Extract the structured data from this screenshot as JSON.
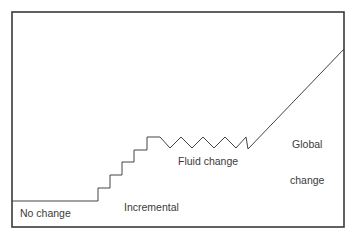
{
  "diagram": {
    "type": "change-progression",
    "colors": {
      "frame": "#3a3a3a",
      "line": "#444444",
      "text": "#3a3a3a",
      "background": "#ffffff"
    },
    "frame": {
      "x1": 12,
      "y1": 12,
      "x2": 344,
      "y2": 227
    },
    "segments": [
      {
        "name": "no-change",
        "label": "No change"
      },
      {
        "name": "incremental-change",
        "label_line1": "Incremental",
        "label_line2": "change",
        "steps": 5
      },
      {
        "name": "fluid-change",
        "label": "Fluid change",
        "zigzag_teeth": 4
      },
      {
        "name": "global-change",
        "label_line1": "Global",
        "label_line2": "change"
      }
    ],
    "path_points": [
      [
        12,
        201
      ],
      [
        98,
        201
      ],
      [
        98,
        188
      ],
      [
        110,
        188
      ],
      [
        110,
        175
      ],
      [
        122,
        175
      ],
      [
        122,
        162
      ],
      [
        134,
        162
      ],
      [
        134,
        150
      ],
      [
        147,
        150
      ],
      [
        147,
        137
      ],
      [
        160,
        137
      ],
      [
        170,
        148
      ],
      [
        181,
        137
      ],
      [
        192,
        148
      ],
      [
        203,
        137
      ],
      [
        214,
        148
      ],
      [
        225,
        137
      ],
      [
        236,
        148
      ],
      [
        246,
        137
      ],
      [
        248,
        149
      ],
      [
        344,
        49
      ]
    ]
  }
}
